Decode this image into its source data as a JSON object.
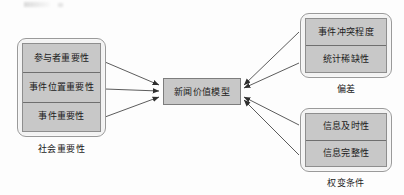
{
  "diagram": {
    "title": "新闻价值模型",
    "center": {
      "label": "新闻价值模型",
      "name": "news-value-model"
    },
    "groups": [
      {
        "id": "social-importance",
        "caption": "社会重要性",
        "position": "left",
        "items": [
          {
            "label": "参与者重要性"
          },
          {
            "label": "事件位置重要性"
          },
          {
            "label": "事件重要性"
          }
        ]
      },
      {
        "id": "deviance",
        "caption": "偏差",
        "position": "top-right",
        "items": [
          {
            "label": "事件冲突程度"
          },
          {
            "label": "统计稀缺性"
          }
        ]
      },
      {
        "id": "contingency-conditions",
        "caption": "权变条件",
        "position": "bottom-right",
        "items": [
          {
            "label": "信息及时性"
          },
          {
            "label": "信息完整性"
          }
        ]
      }
    ],
    "arrows": [
      {
        "from": "参与者重要性",
        "to": "新闻价值模型"
      },
      {
        "from": "事件位置重要性",
        "to": "新闻价值模型"
      },
      {
        "from": "事件重要性",
        "to": "新闻价值模型"
      },
      {
        "from": "事件冲突程度",
        "to": "新闻价值模型"
      },
      {
        "from": "统计稀缺性",
        "to": "新闻价值模型"
      },
      {
        "from": "信息及时性",
        "to": "新闻价值模型"
      },
      {
        "from": "信息完整性",
        "to": "新闻价值模型"
      }
    ],
    "colors": {
      "box_fill": "#c8c8c8",
      "frame_fill": "#f3f3f3",
      "border": "#8e8e8e",
      "arrow": "#4a4a4a",
      "text": "#1b1b1b",
      "background": "#fdfdfd"
    }
  }
}
